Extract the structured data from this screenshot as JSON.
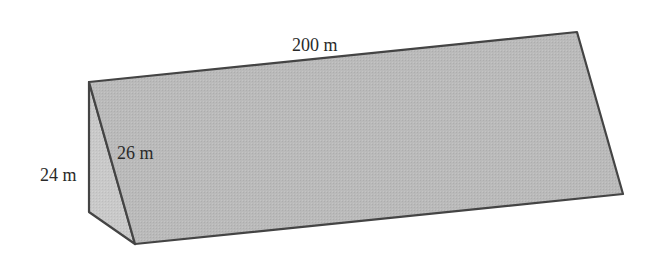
{
  "figure": {
    "type": "triangular-prism",
    "labels": {
      "length": "200 m",
      "slant": "26 m",
      "height": "24 m"
    },
    "colors": {
      "front_face": "#b9b9b9",
      "side_face": "#c8c8c8",
      "stroke": "#444444",
      "background": "#ffffff"
    }
  }
}
